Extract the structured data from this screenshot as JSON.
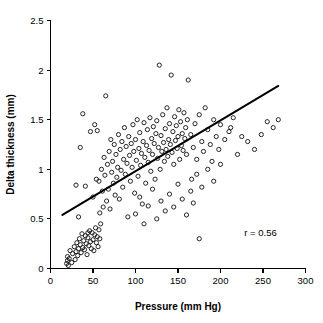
{
  "chart_data": {
    "type": "scatter",
    "title": "",
    "xlabel": "Pressure (mm Hg)",
    "ylabel": "Delta thickness (mm)",
    "xlim": [
      0,
      300
    ],
    "ylim": [
      0,
      2.5
    ],
    "xticks": [
      0,
      50,
      100,
      150,
      200,
      250,
      300
    ],
    "yticks": [
      0,
      0.5,
      1,
      1.5,
      2,
      2.5
    ],
    "xtick_labels": [
      "0",
      "50",
      "100",
      "150",
      "200",
      "250",
      "300"
    ],
    "ytick_labels": [
      "0",
      "0.5",
      "1",
      "1.5",
      "2",
      "2.5"
    ],
    "grid": false,
    "legend": false,
    "marker_style": "open-circle",
    "marker_color": "#1a1a1a",
    "annotations": [
      {
        "text": "r = 0.56",
        "x": 228,
        "y": 0.33
      }
    ],
    "correlation_r": 0.56,
    "trendline": {
      "type": "linear",
      "x_start": 14,
      "y_start": 0.54,
      "x_end": 268,
      "y_end": 1.84,
      "color": "#000000"
    },
    "series": [
      {
        "name": "observations",
        "points": [
          [
            19,
            0.05
          ],
          [
            20,
            0.08
          ],
          [
            20,
            0.12
          ],
          [
            21,
            0.03
          ],
          [
            22,
            0.1
          ],
          [
            23,
            0.18
          ],
          [
            25,
            0.06
          ],
          [
            26,
            0.15
          ],
          [
            28,
            0.22
          ],
          [
            29,
            0.09
          ],
          [
            30,
            0.17
          ],
          [
            31,
            0.26
          ],
          [
            32,
            0.13
          ],
          [
            33,
            0.2
          ],
          [
            34,
            0.3
          ],
          [
            35,
            0.24
          ],
          [
            36,
            0.16
          ],
          [
            37,
            0.35
          ],
          [
            38,
            0.21
          ],
          [
            39,
            0.28
          ],
          [
            40,
            0.19
          ],
          [
            41,
            0.33
          ],
          [
            42,
            0.25
          ],
          [
            43,
            0.14
          ],
          [
            44,
            0.31
          ],
          [
            45,
            0.23
          ],
          [
            46,
            0.38
          ],
          [
            47,
            0.27
          ],
          [
            48,
            0.2
          ],
          [
            49,
            0.36
          ],
          [
            50,
            0.29
          ],
          [
            51,
            0.18
          ],
          [
            52,
            0.34
          ],
          [
            53,
            0.41
          ],
          [
            54,
            0.26
          ],
          [
            55,
            0.32
          ],
          [
            56,
            0.22
          ],
          [
            57,
            0.39
          ],
          [
            58,
            0.3
          ],
          [
            59,
            0.45
          ],
          [
            30,
            0.84
          ],
          [
            33,
            0.52
          ],
          [
            35,
            1.22
          ],
          [
            38,
            1.56
          ],
          [
            41,
            0.83
          ],
          [
            44,
            0.36
          ],
          [
            47,
            1.38
          ],
          [
            50,
            0.72
          ],
          [
            52,
            1.45
          ],
          [
            54,
            0.9
          ],
          [
            55,
            1.39
          ],
          [
            57,
            0.88
          ],
          [
            58,
            0.56
          ],
          [
            60,
            1.0
          ],
          [
            61,
            0.78
          ],
          [
            62,
            0.62
          ],
          [
            63,
            1.12
          ],
          [
            64,
            0.94
          ],
          [
            65,
            1.74
          ],
          [
            66,
            0.68
          ],
          [
            67,
            1.05
          ],
          [
            68,
            0.8
          ],
          [
            69,
            1.18
          ],
          [
            70,
            0.6
          ],
          [
            71,
            1.3
          ],
          [
            72,
            0.97
          ],
          [
            73,
            1.08
          ],
          [
            74,
            0.86
          ],
          [
            75,
            1.25
          ],
          [
            76,
            0.74
          ],
          [
            77,
            1.15
          ],
          [
            78,
            0.92
          ],
          [
            79,
            1.02
          ],
          [
            80,
            1.35
          ],
          [
            81,
            0.7
          ],
          [
            82,
            1.2
          ],
          [
            83,
            0.99
          ],
          [
            84,
            1.28
          ],
          [
            85,
            0.82
          ],
          [
            86,
            1.1
          ],
          [
            87,
            1.42
          ],
          [
            88,
            0.95
          ],
          [
            89,
            1.23
          ],
          [
            90,
            1.06
          ],
          [
            91,
            0.52
          ],
          [
            92,
            1.33
          ],
          [
            93,
            1.14
          ],
          [
            94,
            0.88
          ],
          [
            95,
            1.26
          ],
          [
            96,
            1.02
          ],
          [
            97,
            1.45
          ],
          [
            98,
            1.18
          ],
          [
            99,
            0.76
          ],
          [
            100,
            1.3
          ],
          [
            101,
            1.09
          ],
          [
            102,
            1.5
          ],
          [
            103,
            0.93
          ],
          [
            104,
            1.21
          ],
          [
            105,
            1.37
          ],
          [
            106,
            1.04
          ],
          [
            107,
            1.16
          ],
          [
            108,
            0.65
          ],
          [
            109,
            1.28
          ],
          [
            110,
            1.47
          ],
          [
            111,
            1.12
          ],
          [
            112,
            0.86
          ],
          [
            113,
            1.24
          ],
          [
            114,
            1.4
          ],
          [
            115,
            1.07
          ],
          [
            116,
            1.19
          ],
          [
            117,
            1.52
          ],
          [
            118,
            0.98
          ],
          [
            119,
            1.31
          ],
          [
            120,
            1.15
          ],
          [
            121,
            1.43
          ],
          [
            122,
            1.26
          ],
          [
            123,
            0.9
          ],
          [
            124,
            1.36
          ],
          [
            125,
            1.49
          ],
          [
            126,
            1.11
          ],
          [
            127,
            1.22
          ],
          [
            128,
            2.05
          ],
          [
            129,
            1.0
          ],
          [
            130,
            1.34
          ],
          [
            131,
            1.18
          ],
          [
            132,
            1.55
          ],
          [
            133,
            1.27
          ],
          [
            134,
            1.08
          ],
          [
            135,
            1.41
          ],
          [
            136,
            1.2
          ],
          [
            137,
            1.62
          ],
          [
            138,
            1.13
          ],
          [
            139,
            1.3
          ],
          [
            140,
            1.46
          ],
          [
            141,
            1.25
          ],
          [
            142,
            1.95
          ],
          [
            143,
            1.17
          ],
          [
            144,
            1.38
          ],
          [
            145,
            1.05
          ],
          [
            146,
            1.53
          ],
          [
            147,
            1.29
          ],
          [
            148,
            1.44
          ],
          [
            149,
            1.21
          ],
          [
            150,
            1.33
          ],
          [
            151,
            1.6
          ],
          [
            152,
            1.1
          ],
          [
            153,
            1.48
          ],
          [
            154,
            1.24
          ],
          [
            155,
            1.36
          ],
          [
            156,
            1.19
          ],
          [
            157,
            1.57
          ],
          [
            158,
            1.31
          ],
          [
            159,
            1.42
          ],
          [
            160,
            1.15
          ],
          [
            161,
            1.5
          ],
          [
            100,
            0.55
          ],
          [
            105,
            0.72
          ],
          [
            110,
            0.45
          ],
          [
            115,
            0.63
          ],
          [
            120,
            0.8
          ],
          [
            125,
            0.5
          ],
          [
            130,
            0.68
          ],
          [
            135,
            0.58
          ],
          [
            140,
            0.75
          ],
          [
            145,
            0.62
          ],
          [
            150,
            0.85
          ],
          [
            155,
            0.7
          ],
          [
            160,
            0.54
          ],
          [
            165,
            0.78
          ],
          [
            168,
            0.66
          ],
          [
            162,
            1.9
          ],
          [
            165,
            1.35
          ],
          [
            168,
            1.22
          ],
          [
            170,
            1.46
          ],
          [
            172,
            1.1
          ],
          [
            175,
            1.55
          ],
          [
            178,
            1.28
          ],
          [
            180,
            1.18
          ],
          [
            182,
            1.62
          ],
          [
            185,
            1.4
          ],
          [
            188,
            1.25
          ],
          [
            190,
            1.08
          ],
          [
            192,
            1.5
          ],
          [
            195,
            1.33
          ],
          [
            198,
            1.2
          ],
          [
            200,
            1.45
          ],
          [
            205,
            1.3
          ],
          [
            210,
            1.38
          ],
          [
            215,
            1.52
          ],
          [
            220,
            1.15
          ],
          [
            166,
            0.9
          ],
          [
            172,
            0.95
          ],
          [
            178,
            0.82
          ],
          [
            185,
            1.0
          ],
          [
            192,
            0.88
          ],
          [
            175,
            0.3
          ],
          [
            200,
            1.05
          ],
          [
            212,
            1.42
          ],
          [
            225,
            1.33
          ],
          [
            232,
            1.28
          ],
          [
            240,
            1.2
          ],
          [
            248,
            1.35
          ],
          [
            255,
            1.48
          ],
          [
            262,
            1.42
          ],
          [
            268,
            1.5
          ]
        ]
      }
    ]
  }
}
